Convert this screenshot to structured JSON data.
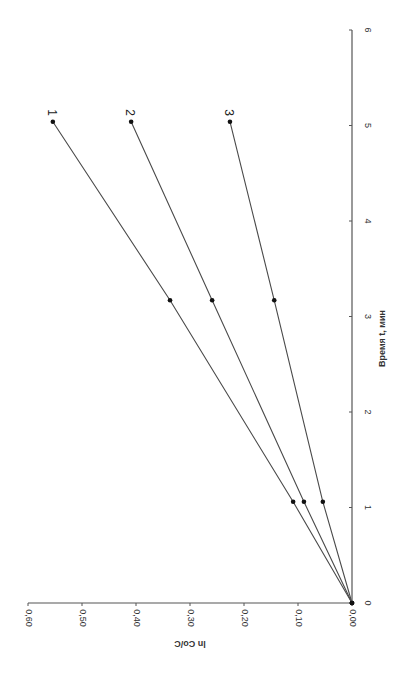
{
  "chart_data": {
    "type": "line",
    "orientation_note": "figure rotated 90 degrees clockwise",
    "title": "",
    "xlabel": "Время t, мин",
    "ylabel": "ln Co/C",
    "xlim": [
      0,
      6
    ],
    "ylim": [
      0.0,
      0.6
    ],
    "x_ticks": [
      "0",
      "1",
      "2",
      "3",
      "4",
      "5",
      "6"
    ],
    "y_ticks": [
      "0,00",
      "0,10",
      "0,20",
      "0,30",
      "0,40",
      "0,50",
      "0,60"
    ],
    "grid": false,
    "legend": "inline labels at line ends",
    "series": [
      {
        "name": "1",
        "x": [
          0,
          1.06,
          3.17,
          5.04
        ],
        "y": [
          0.0,
          0.109,
          0.337,
          0.554
        ]
      },
      {
        "name": "2",
        "x": [
          0,
          1.06,
          3.17,
          5.04
        ],
        "y": [
          0.0,
          0.089,
          0.259,
          0.409
        ]
      },
      {
        "name": "3",
        "x": [
          0,
          1.06,
          3.17,
          5.04
        ],
        "y": [
          0.0,
          0.054,
          0.144,
          0.226
        ]
      }
    ]
  },
  "colors": {
    "line": "#4a4a4a",
    "marker": "#111111",
    "axis": "#555555"
  }
}
